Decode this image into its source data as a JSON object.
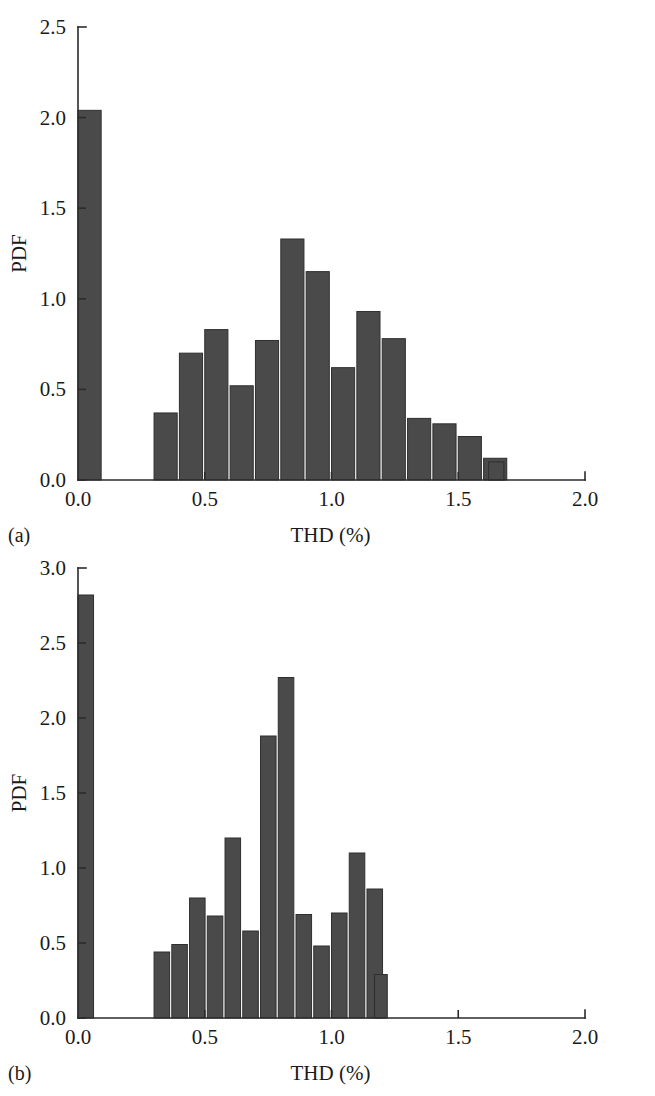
{
  "figure": {
    "panels": [
      {
        "tag": "(a)",
        "xlabel": "THD (%)",
        "ylabel": "PDF",
        "xticks": [
          "0.0",
          "0.5",
          "1.0",
          "1.5",
          "2.0"
        ],
        "yticks": [
          "0.0",
          "0.5",
          "1.0",
          "1.5",
          "2.0",
          "2.5"
        ]
      },
      {
        "tag": "(b)",
        "xlabel": "THD (%)",
        "ylabel": "PDF",
        "xticks": [
          "0.0",
          "0.5",
          "1.0",
          "1.5",
          "2.0"
        ],
        "yticks": [
          "0.0",
          "0.5",
          "1.0",
          "1.5",
          "2.0",
          "2.5",
          "3.0"
        ]
      }
    ]
  },
  "chart_data": [
    {
      "type": "bar",
      "title": "",
      "panel": "(a)",
      "xlabel": "THD (%)",
      "ylabel": "PDF",
      "xlim": [
        0.0,
        2.0
      ],
      "ylim": [
        0.0,
        2.5
      ],
      "xticks": [
        0.0,
        0.5,
        1.0,
        1.5,
        2.0
      ],
      "yticks": [
        0.0,
        0.5,
        1.0,
        1.5,
        2.0,
        2.5
      ],
      "grid": false,
      "legend": "none",
      "bin_width": 0.1,
      "bin_starts": [
        0.0,
        0.3,
        0.4,
        0.5,
        0.6,
        0.7,
        0.8,
        0.9,
        1.0,
        1.1,
        1.2,
        1.3,
        1.4,
        1.5,
        1.6
      ],
      "categories": [
        "0.0",
        "0.3",
        "0.4",
        "0.5",
        "0.6",
        "0.7",
        "0.8",
        "0.9",
        "1.0",
        "1.1",
        "1.2",
        "1.3",
        "1.4",
        "1.5",
        "1.6"
      ],
      "values": [
        2.04,
        0.37,
        0.7,
        0.83,
        0.52,
        0.77,
        1.33,
        1.15,
        0.62,
        0.93,
        0.78,
        0.34,
        0.31,
        0.24,
        0.12
      ],
      "extra_bar": {
        "bin_start": 1.62,
        "bin_width": 0.06,
        "value": 0.1
      }
    },
    {
      "type": "bar",
      "title": "",
      "panel": "(b)",
      "xlabel": "THD (%)",
      "ylabel": "PDF",
      "xlim": [
        0.0,
        2.0
      ],
      "ylim": [
        0.0,
        3.0
      ],
      "xticks": [
        0.0,
        0.5,
        1.0,
        1.5,
        2.0
      ],
      "yticks": [
        0.0,
        0.5,
        1.0,
        1.5,
        2.0,
        2.5,
        3.0
      ],
      "grid": false,
      "legend": "none",
      "bin_width": 0.07,
      "bin_starts": [
        0.0,
        0.3,
        0.37,
        0.44,
        0.51,
        0.58,
        0.65,
        0.72,
        0.79,
        0.86,
        0.93,
        1.0,
        1.07,
        1.14
      ],
      "categories": [
        "0.00",
        "0.30",
        "0.37",
        "0.44",
        "0.51",
        "0.58",
        "0.65",
        "0.72",
        "0.79",
        "0.86",
        "0.93",
        "1.00",
        "1.07",
        "1.14"
      ],
      "values": [
        2.82,
        0.44,
        0.49,
        0.8,
        0.68,
        1.2,
        0.58,
        1.88,
        2.27,
        0.69,
        0.48,
        0.7,
        1.1,
        0.86
      ],
      "extra_bar": {
        "bin_start": 1.17,
        "bin_width": 0.05,
        "value": 0.29
      }
    }
  ]
}
